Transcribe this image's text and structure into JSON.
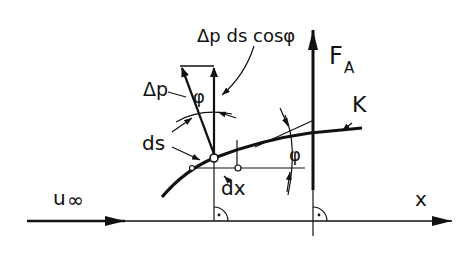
{
  "diagram": {
    "type": "airfoil-pressure-force-element",
    "colors": {
      "ink": "#111111",
      "background": "#ffffff"
    },
    "labels": {
      "dp_ds_cos": "Δp ds cosφ",
      "dp": "Δp",
      "phi_top": "φ",
      "phi_right": "φ",
      "ds": "ds",
      "dx": "dx",
      "force": "F",
      "force_sub": "A",
      "contour": "K",
      "freestream": "u",
      "freestream_sub": "∞",
      "x_axis": "x"
    },
    "elements": [
      "x-axis-arrow",
      "freestream-arrow",
      "contour-curve-K",
      "lift-force-arrow-FA",
      "pressure-arrow-dp",
      "vertical-component-arrow",
      "tangent-line",
      "right-angle-marks"
    ]
  }
}
